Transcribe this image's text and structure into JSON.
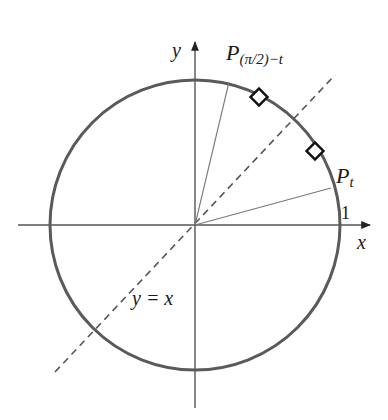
{
  "diagram": {
    "colors": {
      "circle": "#555555",
      "axes": "#555555",
      "radius": "#777777",
      "dashed_line": "#555555",
      "markers": "#111111",
      "text": "#1a1a1a"
    },
    "geometry": {
      "origin": [
        195,
        225
      ],
      "radius_px": 145,
      "x_axis": {
        "from": [
          18,
          225
        ],
        "to": [
          372,
          225
        ]
      },
      "y_axis": {
        "from": [
          195,
          408
        ],
        "to": [
          195,
          40
        ]
      },
      "dashed_line": {
        "from": [
          55,
          372
        ],
        "to": [
          335,
          75
        ]
      },
      "radius_to_Pt": {
        "to": [
          331,
          188
        ]
      },
      "radius_to_P_complement": {
        "to": [
          229,
          82
        ]
      },
      "markers": [
        {
          "shape": "diamond",
          "at": [
            259,
            97
          ]
        },
        {
          "shape": "diamond",
          "at": [
            315,
            151
          ]
        }
      ]
    },
    "labels": {
      "x_axis": "x",
      "y_axis": "y",
      "one": "1",
      "line": "y = x",
      "point_t_main": "P",
      "point_t_sub": "t",
      "point_comp_main": "P",
      "point_comp_sub": "(π/2)−t"
    }
  }
}
